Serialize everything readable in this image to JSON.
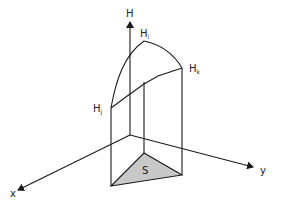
{
  "diagram": {
    "labels": {
      "h_axis": "H",
      "x_axis": "x",
      "y_axis": "y",
      "area": "S",
      "point_i": {
        "base": "H",
        "sub": "i"
      },
      "point_j": {
        "base": "H",
        "sub": "j"
      },
      "point_k": {
        "base": "H",
        "sub": "k"
      }
    },
    "colors": {
      "line": "#1a1a1a",
      "triangle_fill": "#c8c8c8",
      "background": "#ffffff"
    }
  }
}
